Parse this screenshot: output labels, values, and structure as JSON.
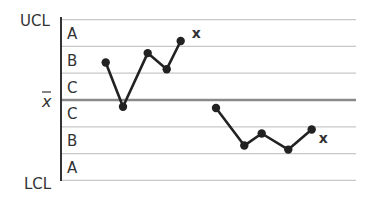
{
  "chart_data": {
    "type": "line",
    "title": "",
    "xlabel": "",
    "ylabel": "",
    "grid": true,
    "y_labels": {
      "ucl": "UCL",
      "center": "x̄",
      "lcl": "LCL"
    },
    "zones_upper": [
      "A",
      "B",
      "C"
    ],
    "zones_lower": [
      "C",
      "B",
      "A"
    ],
    "zone_scale": "sigma from center: C=0-1, B=1-2, A=2-3",
    "ylim": [
      -3,
      3
    ],
    "series": [
      {
        "name": "run above center",
        "x": [
          1,
          2,
          3,
          4,
          5
        ],
        "values": [
          1.4,
          -0.25,
          1.75,
          1.15,
          2.2
        ],
        "end_marker": "x"
      },
      {
        "name": "run below center",
        "x": [
          7,
          8,
          9,
          10,
          11
        ],
        "values": [
          -0.3,
          -1.7,
          -1.25,
          -1.85,
          -1.1
        ],
        "end_marker": "x"
      }
    ],
    "annotations": [
      "x",
      "x"
    ]
  },
  "colors": {
    "line": "#222222",
    "grid": "#c8c8c8",
    "center": "#8a8a8a",
    "axis": "#333333"
  }
}
